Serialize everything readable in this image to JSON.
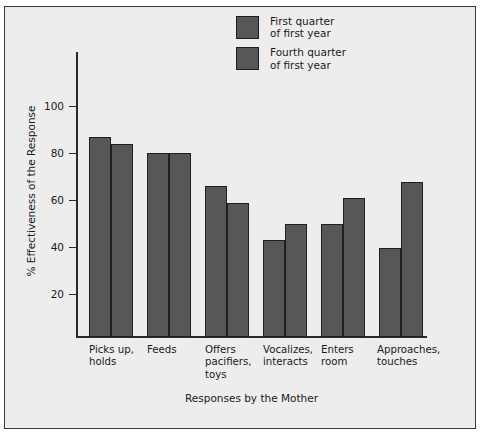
{
  "chart_data": {
    "type": "bar",
    "title": "",
    "xlabel": "Responses by the Mother",
    "ylabel": "% Effectiveness of the Response",
    "categories": [
      "Picks up,\nholds",
      "Feeds",
      "Offers\npacifiers,\ntoys",
      "Vocalizes,\ninteracts",
      "Enters\nroom",
      "Approaches,\ntouches"
    ],
    "series": [
      {
        "name": "First quarter\nof first year",
        "values": [
          85,
          78,
          64,
          41,
          48,
          38
        ],
        "color": "#575757"
      },
      {
        "name": "Fourth quarter\nof first year",
        "values": [
          82,
          78,
          57,
          48,
          59,
          66
        ],
        "color": "#575757"
      }
    ],
    "ylim": [
      0,
      110
    ],
    "yticks": [
      20,
      40,
      60,
      80,
      100
    ],
    "ytick_labels": [
      "20",
      "40",
      "60",
      "80",
      "100"
    ],
    "grid": false,
    "legend_position": "top-center"
  },
  "legend": {
    "entries": [
      {
        "label": "First quarter\nof first year"
      },
      {
        "label": "Fourth quarter\nof first year"
      }
    ]
  },
  "axes": {
    "y_title": "% Effectiveness of the Response",
    "x_title": "Responses by the Mother"
  }
}
